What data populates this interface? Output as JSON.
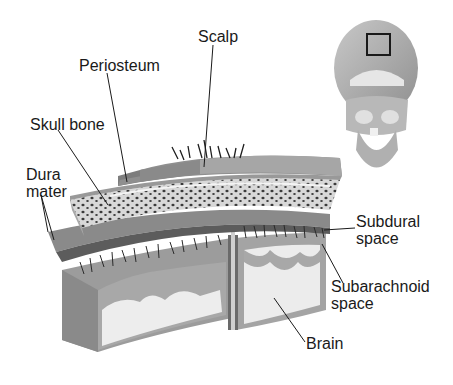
{
  "diagram": {
    "type": "anatomical-cross-section",
    "labels": {
      "scalp": "Scalp",
      "periosteum": "Periosteum",
      "skull_bone": "Skull bone",
      "dura_mater_line1": "Dura",
      "dura_mater_line2": "mater",
      "subdural_line1": "Subdural",
      "subdural_line2": "space",
      "subarachnoid_line1": "Subarachnoid",
      "subarachnoid_line2": "space",
      "brain": "Brain"
    },
    "inset": {
      "description": "Skull front view with locator box on crown",
      "icon": "skull-icon"
    },
    "colors": {
      "scalp": "#9a9a9a",
      "periosteum": "#7d7d7d",
      "bone": "#d8d8d8",
      "bone_pores": "#3a3a3a",
      "dura": "#8a8a8a",
      "gray_matter": "#a8a8a8",
      "white_matter": "#ededed",
      "text": "#1a1a1a"
    }
  }
}
